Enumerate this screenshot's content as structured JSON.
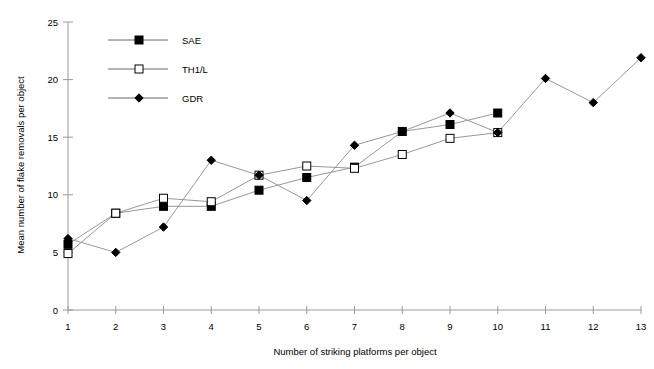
{
  "chart_data": {
    "type": "line",
    "title": "",
    "xlabel": "Number of striking platforms per object",
    "ylabel": "Mean number of flake removals per object",
    "x": [
      1,
      2,
      3,
      4,
      5,
      6,
      7,
      8,
      9,
      10,
      11,
      12,
      13
    ],
    "xlim": [
      1,
      13
    ],
    "ylim": [
      0,
      25
    ],
    "xticks": [
      "1",
      "2",
      "3",
      "4",
      "5",
      "6",
      "7",
      "8",
      "9",
      "10",
      "11",
      "12",
      "13"
    ],
    "yticks": [
      "0",
      "5",
      "10",
      "15",
      "20",
      "25"
    ],
    "grid": false,
    "legend_position": "top-left-inside",
    "series": [
      {
        "name": "SAE",
        "marker": "filled-square",
        "x": [
          1,
          2,
          3,
          4,
          5,
          6,
          7,
          8,
          9,
          10
        ],
        "values": [
          5.7,
          8.4,
          9.0,
          9.0,
          10.4,
          11.5,
          12.4,
          15.5,
          16.1,
          17.1
        ]
      },
      {
        "name": "TH1/L",
        "marker": "open-square",
        "x": [
          1,
          2,
          3,
          4,
          5,
          6,
          7,
          8,
          9,
          10
        ],
        "values": [
          4.9,
          8.4,
          9.7,
          9.4,
          11.7,
          12.5,
          12.3,
          13.5,
          14.9,
          15.4
        ]
      },
      {
        "name": "GDR",
        "marker": "filled-diamond",
        "x": [
          1,
          2,
          3,
          4,
          5,
          6,
          7,
          8,
          9,
          10,
          11,
          12,
          13
        ],
        "values": [
          6.2,
          5.0,
          7.2,
          13.0,
          11.7,
          9.5,
          14.3,
          15.5,
          17.1,
          15.4,
          20.1,
          18.0,
          21.9
        ]
      }
    ]
  },
  "legend": {
    "items": [
      {
        "label": "SAE"
      },
      {
        "label": "TH1/L"
      },
      {
        "label": "GDR"
      }
    ]
  },
  "colors": {
    "axis": "#9a9a9a",
    "line": "#8c8c8c",
    "marker": "#000000",
    "background": "#ffffff"
  }
}
